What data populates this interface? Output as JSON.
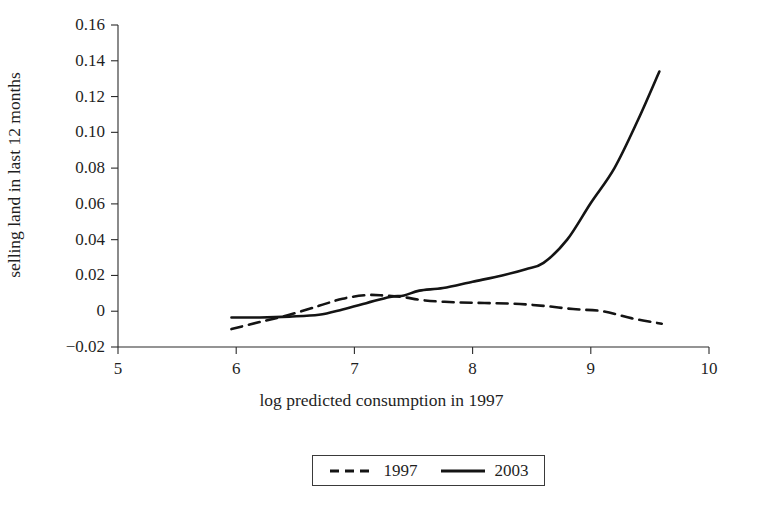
{
  "chart_data": {
    "type": "line",
    "title": "",
    "xlabel": "log predicted consumption in 1997",
    "ylabel": "selling land in last 12 months",
    "xlim": [
      5,
      10
    ],
    "ylim": [
      -0.02,
      0.16
    ],
    "xticks": [
      "5",
      "6",
      "7",
      "8",
      "9",
      "10"
    ],
    "yticks": [
      "0.16",
      "0.14",
      "0.12",
      "0.10",
      "0.08",
      "0.06",
      "0.04",
      "0.02",
      "0",
      "−0.02"
    ],
    "ytick_values": [
      0.16,
      0.14,
      0.12,
      0.1,
      0.08,
      0.06,
      0.04,
      0.02,
      0,
      -0.02
    ],
    "xtick_values": [
      5,
      6,
      7,
      8,
      9,
      10
    ],
    "grid": false,
    "legend_position": "bottom-center",
    "series": [
      {
        "name": "1997",
        "style": "dashed",
        "color": "#141414",
        "x": [
          5.96,
          6.2,
          6.45,
          6.7,
          6.9,
          7.1,
          7.25,
          7.4,
          7.6,
          7.85,
          8.1,
          8.35,
          8.6,
          8.85,
          9.1,
          9.35,
          9.6
        ],
        "y": [
          -0.01,
          -0.006,
          -0.002,
          0.003,
          0.007,
          0.009,
          0.0088,
          0.008,
          0.006,
          0.005,
          0.0046,
          0.0042,
          0.003,
          0.0012,
          0.0,
          -0.004,
          -0.007
        ]
      },
      {
        "name": "2003",
        "style": "solid",
        "color": "#141414",
        "x": [
          5.96,
          6.2,
          6.45,
          6.7,
          6.9,
          7.1,
          7.3,
          7.42,
          7.55,
          7.75,
          8.0,
          8.25,
          8.45,
          8.6,
          8.8,
          9.0,
          9.2,
          9.4,
          9.58
        ],
        "y": [
          -0.0035,
          -0.0035,
          -0.003,
          -0.002,
          0.001,
          0.0045,
          0.008,
          0.0088,
          0.0115,
          0.013,
          0.0165,
          0.02,
          0.0235,
          0.027,
          0.04,
          0.0605,
          0.08,
          0.107,
          0.134
        ]
      }
    ],
    "legend": [
      {
        "label": "1997",
        "style": "dashed"
      },
      {
        "label": "2003",
        "style": "solid"
      }
    ]
  },
  "axes": {
    "x_axis_name": "x-axis",
    "y_axis_name": "y-axis"
  }
}
